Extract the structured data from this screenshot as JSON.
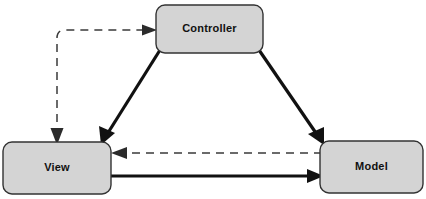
{
  "diagram": {
    "canvas": {
      "width": 426,
      "height": 199,
      "background": "#ffffff"
    },
    "style": {
      "node_fill": "#d4d4d4",
      "node_stroke": "#333333",
      "node_corner_radius": 9,
      "solid_edge_color": "#111111",
      "dashed_edge_color": "#3a3a3a",
      "label_color": "#111111",
      "dash_pattern": "8 6"
    },
    "nodes": [
      {
        "id": "controller",
        "label": "Controller",
        "x": 156,
        "y": 5,
        "width": 107,
        "height": 48
      },
      {
        "id": "view",
        "label": "View",
        "x": 3,
        "y": 142,
        "width": 108,
        "height": 52
      },
      {
        "id": "model",
        "label": "Model",
        "x": 320,
        "y": 141,
        "width": 103,
        "height": 52
      }
    ],
    "edges": [
      {
        "id": "controller-to-view",
        "from": "controller",
        "to": "view",
        "style": "solid",
        "arrow": "end",
        "label": ""
      },
      {
        "id": "controller-to-model",
        "from": "controller",
        "to": "model",
        "style": "solid",
        "arrow": "end",
        "label": ""
      },
      {
        "id": "view-to-model",
        "from": "view",
        "to": "model",
        "style": "solid",
        "arrow": "end",
        "label": ""
      },
      {
        "id": "model-to-view",
        "from": "model",
        "to": "view",
        "style": "dashed",
        "arrow": "end",
        "label": ""
      },
      {
        "id": "view-to-controller",
        "from": "view",
        "to": "controller",
        "style": "dashed",
        "arrow": "end",
        "label": ""
      }
    ]
  }
}
